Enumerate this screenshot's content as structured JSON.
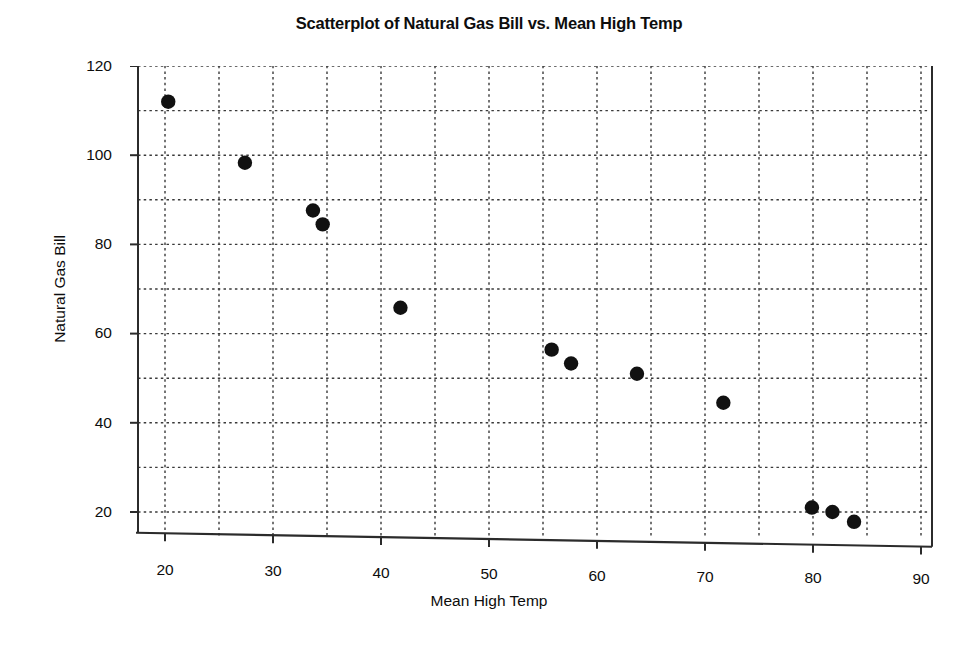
{
  "chart_data": {
    "type": "scatter",
    "title": "Scatterplot of Natural Gas Bill vs. Mean High Temp",
    "xlabel": "Mean High Temp",
    "ylabel": "Natural Gas Bill",
    "xlim": [
      17.5,
      90
    ],
    "ylim": [
      14,
      121
    ],
    "xticks": [
      20,
      30,
      40,
      50,
      60,
      70,
      80,
      90
    ],
    "yticks": [
      20,
      40,
      60,
      80,
      100,
      120
    ],
    "xticks_minor": [
      25,
      35,
      45,
      55,
      65,
      75,
      85
    ],
    "yticks_minor": [
      30,
      50,
      70,
      90,
      110
    ],
    "grid": "dotted-both-major-and-minor",
    "legend": "none",
    "marker": "filled-circle",
    "marker_color": "#111111",
    "points": [
      {
        "x": 20.3,
        "y": 112.0
      },
      {
        "x": 27.4,
        "y": 98.3
      },
      {
        "x": 33.7,
        "y": 87.6
      },
      {
        "x": 34.6,
        "y": 84.5
      },
      {
        "x": 41.8,
        "y": 65.8
      },
      {
        "x": 55.8,
        "y": 56.4
      },
      {
        "x": 57.6,
        "y": 53.3
      },
      {
        "x": 63.7,
        "y": 51.0
      },
      {
        "x": 71.7,
        "y": 44.5
      },
      {
        "x": 79.9,
        "y": 21.0
      },
      {
        "x": 81.8,
        "y": 20.0
      },
      {
        "x": 83.8,
        "y": 17.8
      }
    ]
  },
  "axes": {
    "ytick_labels": [
      "120",
      "100",
      "80",
      "60",
      "40",
      "20"
    ],
    "xtick_labels": [
      "20",
      "30",
      "40",
      "50",
      "60",
      "70",
      "80",
      "90"
    ]
  }
}
